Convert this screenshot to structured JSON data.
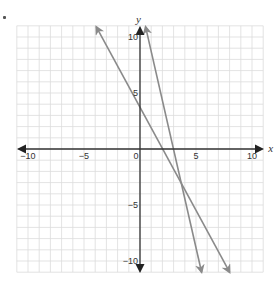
{
  "problem_marker": ".",
  "chart_data": {
    "type": "line",
    "title": "",
    "xlabel": "x",
    "ylabel": "y",
    "xlim": [
      -11,
      11
    ],
    "ylim": [
      -11,
      11
    ],
    "grid": true,
    "grid_step": 1,
    "x_ticks": [
      {
        "value": -10,
        "label": "−10"
      },
      {
        "value": -5,
        "label": "−5"
      },
      {
        "value": 0,
        "label": "0"
      },
      {
        "value": 5,
        "label": "5"
      },
      {
        "value": 10,
        "label": "10"
      }
    ],
    "y_ticks": [
      {
        "value": 10,
        "label": "10"
      },
      {
        "value": 5,
        "label": "5"
      },
      {
        "value": -5,
        "label": "−5"
      },
      {
        "value": -10,
        "label": "−10"
      }
    ],
    "series": [
      {
        "name": "line 1",
        "equation_approx": "y = -1.83x + 4.1",
        "x": [
          -3.9,
          8.0
        ],
        "y": [
          10.9,
          -11.0
        ],
        "color": "#8a8a8a",
        "arrows": "both"
      },
      {
        "name": "line 2",
        "equation_approx": "y = -4.38x + 13.1",
        "x": [
          0.5,
          5.5
        ],
        "y": [
          10.9,
          -11.0
        ],
        "color": "#8a8a8a",
        "arrows": "both"
      }
    ],
    "annotations": [
      {
        "type": "intersection",
        "x": 3.8,
        "y": -3.0
      }
    ],
    "colors": {
      "axis": "#333333",
      "grid": "#dcdcdc",
      "lines": "#8a8a8a"
    }
  }
}
